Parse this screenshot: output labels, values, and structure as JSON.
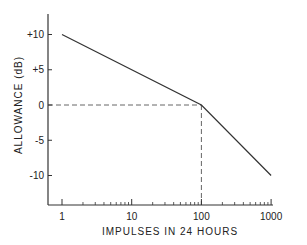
{
  "chart_data": {
    "type": "line",
    "title": "",
    "xlabel": "IMPULSES IN 24 HOURS",
    "ylabel": "ALLOWANCE (dB)",
    "xscale": "log",
    "xlim": [
      0.8,
      1800
    ],
    "ylim": [
      -14,
      13
    ],
    "x_ticks": [
      1,
      10,
      100,
      1000
    ],
    "x_tick_labels": [
      "1",
      "10",
      "100",
      "1000"
    ],
    "y_ticks": [
      10,
      5,
      0,
      -5,
      -10
    ],
    "y_tick_labels": [
      "+10",
      "+5",
      "0",
      "-5",
      "-10"
    ],
    "grid": false,
    "legend": null,
    "series": [
      {
        "name": "allowance",
        "style": "solid",
        "x": [
          1,
          100,
          1000
        ],
        "y": [
          10,
          0,
          -10
        ]
      }
    ],
    "reference_lines": [
      {
        "name": "zero-dB-guide",
        "style": "dashed",
        "from": [
          0.8,
          0
        ],
        "to": [
          100,
          0
        ]
      },
      {
        "name": "100-impulses-guide",
        "style": "dashed",
        "from": [
          100,
          0
        ],
        "to": [
          100,
          -14
        ]
      }
    ]
  },
  "colors": {
    "line": "#333333",
    "axis": "#333333",
    "dashed": "#555555",
    "background": "#ffffff"
  }
}
